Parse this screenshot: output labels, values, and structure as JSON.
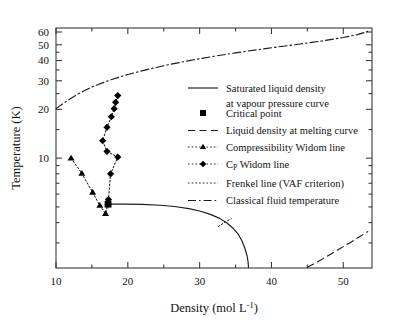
{
  "chart_data": {
    "type": "line",
    "title": "",
    "xlabel": "Density (mol L",
    "xlabel_sup": "-1",
    "xlabel_tail": ")",
    "ylabel": "Temperature (K)",
    "xscale": "linear",
    "yscale": "log",
    "xlim": [
      10,
      54
    ],
    "ylim": [
      2.1,
      63.5
    ],
    "grid": false,
    "xticks": [
      10,
      20,
      30,
      40,
      50
    ],
    "xticklabels": [
      "10",
      "20",
      "30",
      "40",
      "50"
    ],
    "xticks_minor": [
      15,
      25,
      35,
      45
    ],
    "yticks": [
      10,
      20,
      30,
      40,
      50,
      60
    ],
    "yticklabels": [
      "10",
      "20",
      "30",
      "40",
      "50",
      "60"
    ],
    "yticks_minor": [
      3,
      4,
      5,
      6,
      7,
      8,
      9,
      15,
      25,
      35,
      45
    ],
    "legend_position": "center-right",
    "series": [
      {
        "name": "Saturated liquid density at vapour pressure curve",
        "style": "solid",
        "marker": "none",
        "color": "#1a1a1a",
        "points": [
          [
            17.3,
            5.2
          ],
          [
            19.5,
            5.2
          ],
          [
            22.0,
            5.18
          ],
          [
            24.5,
            5.12
          ],
          [
            26.5,
            5.03
          ],
          [
            28.5,
            4.88
          ],
          [
            30.0,
            4.72
          ],
          [
            31.5,
            4.5
          ],
          [
            32.8,
            4.25
          ],
          [
            33.8,
            3.98
          ],
          [
            34.7,
            3.68
          ],
          [
            35.4,
            3.38
          ],
          [
            35.9,
            3.08
          ],
          [
            36.3,
            2.78
          ],
          [
            36.6,
            2.5
          ],
          [
            36.75,
            2.28
          ],
          [
            36.8,
            2.12
          ]
        ]
      },
      {
        "name": "Critical point",
        "style": "none",
        "marker": "square",
        "color": "#000000",
        "points": [
          [
            17.25,
            5.2
          ]
        ]
      },
      {
        "name": "Liquid density at melting curve",
        "style": "dashed",
        "marker": "none",
        "color": "#1a1a1a",
        "points": [
          [
            45.0,
            2.12
          ],
          [
            46.5,
            2.3
          ],
          [
            48.0,
            2.52
          ],
          [
            49.5,
            2.76
          ],
          [
            51.0,
            3.02
          ],
          [
            52.3,
            3.28
          ],
          [
            53.4,
            3.52
          ]
        ]
      },
      {
        "name": "Compressibility Widom line",
        "style": "dotted",
        "marker": "triangle",
        "color": "#000000",
        "points": [
          [
            12.1,
            10.0
          ],
          [
            13.6,
            8.05
          ],
          [
            15.1,
            6.15
          ],
          [
            16.1,
            5.1
          ],
          [
            16.9,
            4.55
          ],
          [
            17.25,
            5.2
          ]
        ]
      },
      {
        "name": "C_P Widom line",
        "style": "dotted",
        "marker": "diamond",
        "color": "#000000",
        "points": [
          [
            18.6,
            24.3
          ],
          [
            18.3,
            22.1
          ],
          [
            18.1,
            20.2
          ],
          [
            17.7,
            18.0
          ],
          [
            17.1,
            15.5
          ],
          [
            16.5,
            12.8
          ],
          [
            17.1,
            11.0
          ],
          [
            18.6,
            10.15
          ],
          [
            17.6,
            8.0
          ],
          [
            17.3,
            5.55
          ],
          [
            17.25,
            5.2
          ]
        ]
      },
      {
        "name": "Frenkel line (VAF criterion)",
        "style": "dotted",
        "marker": "none",
        "color": "#1a1a1a",
        "points": [
          [
            32.6,
            3.78
          ],
          [
            33.6,
            4.05
          ],
          [
            34.4,
            4.22
          ]
        ]
      },
      {
        "name": "Classical fluid temperature",
        "style": "dashdot",
        "marker": "none",
        "color": "#1a1a1a",
        "points": [
          [
            10.0,
            20.2
          ],
          [
            11.5,
            22.5
          ],
          [
            13.0,
            24.8
          ],
          [
            15.0,
            27.5
          ],
          [
            17.5,
            30.3
          ],
          [
            20.0,
            32.8
          ],
          [
            23.0,
            35.5
          ],
          [
            26.0,
            38.0
          ],
          [
            29.0,
            40.3
          ],
          [
            32.0,
            42.5
          ],
          [
            35.0,
            44.6
          ],
          [
            38.0,
            46.6
          ],
          [
            41.0,
            48.6
          ],
          [
            44.0,
            50.6
          ],
          [
            47.0,
            52.8
          ],
          [
            50.0,
            55.5
          ],
          [
            52.0,
            57.8
          ],
          [
            53.4,
            60.5
          ]
        ]
      }
    ],
    "legend": [
      {
        "label": "Saturated liquid density",
        "label2": "at vapour pressure curve",
        "style": "solid",
        "marker": "none"
      },
      {
        "label": "Critical point",
        "style": "none",
        "marker": "square"
      },
      {
        "label": "Liquid density at melting curve",
        "style": "dashed",
        "marker": "none"
      },
      {
        "label": "Compressibility Widom line",
        "style": "dotted",
        "marker": "triangle"
      },
      {
        "label": "C",
        "label_sub": "P",
        "label_tail": " Widom line",
        "style": "dotted",
        "marker": "diamond"
      },
      {
        "label": "Frenkel line (VAF criterion)",
        "style": "dotted",
        "marker": "none"
      },
      {
        "label": "Classical fluid temperature",
        "style": "dashdot",
        "marker": "none"
      }
    ]
  }
}
